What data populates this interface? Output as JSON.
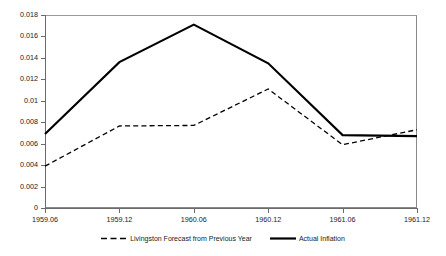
{
  "chart_data": {
    "type": "line",
    "title": "",
    "subtitle": "",
    "xlabel": "",
    "ylabel": "",
    "grid": false,
    "legend_position": "bottom-center",
    "categories": [
      "1959.06",
      "1959.12",
      "1960.06",
      "1960.12",
      "1961.06",
      "1961.12"
    ],
    "x_tick_labels": [
      "1959.06",
      "1959.12",
      "1960.06",
      "1960.12",
      "1961.06",
      "1961.12"
    ],
    "y_tick_labels": [
      "0",
      "0.002",
      "0.004",
      "0.006",
      "0.008",
      "0.01",
      "0.012",
      "0.014",
      "0.016",
      "0.018"
    ],
    "y_tick_values": [
      0,
      0.002,
      0.004,
      0.006,
      0.008,
      0.01,
      0.012,
      0.014,
      0.016,
      0.018
    ],
    "ylim": [
      0,
      0.018
    ],
    "xlim": [
      "1959.06",
      "1961.12"
    ],
    "series": [
      {
        "name": "Livingston Forecast from Previous Year",
        "style": "dashed",
        "color": "#000000",
        "values": [
          0.0039,
          0.00765,
          0.0077,
          0.0111,
          0.0059,
          0.0073
        ]
      },
      {
        "name": "Actual Inflation",
        "style": "solid",
        "color": "#000000",
        "values": [
          0.0069,
          0.0136,
          0.0171,
          0.0135,
          0.0068,
          0.0067
        ]
      }
    ]
  },
  "legend": {
    "items": [
      {
        "label": "Livingston Forecast from Previous Year",
        "style": "dashed"
      },
      {
        "label": "Actual Inflation",
        "style": "solid"
      }
    ]
  },
  "axes": {
    "y_labels": [
      "0.018",
      "0.016",
      "0.014",
      "0.012",
      "0.01",
      "0.008",
      "0.006",
      "0.004",
      "0.002",
      "0"
    ],
    "x_labels": [
      "1959.06",
      "1959.12",
      "1960.06",
      "1960.12",
      "1961.06",
      "1961.12"
    ]
  },
  "colors": {
    "line": "#000000",
    "axis": "#6b6b6b",
    "frame": "#8a8a8a",
    "background": "#ffffff",
    "text": "#1a1a1a"
  }
}
